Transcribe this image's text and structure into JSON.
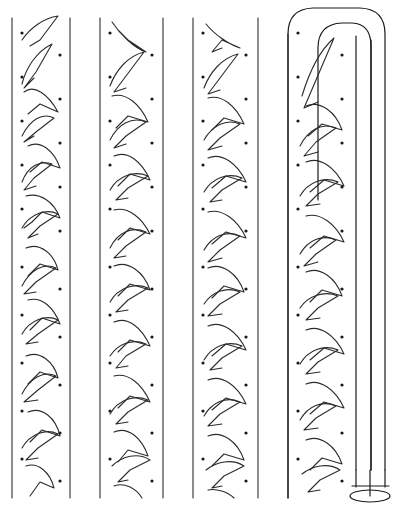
{
  "figure": {
    "type": "technical-line-drawing",
    "canvas": {
      "width": 404,
      "height": 516,
      "background": "#ffffff"
    },
    "stroke_color": "#1a1a1a",
    "glyph_color": "#2b2b2b",
    "dot_color": "#1a1a1a"
  },
  "geometry": {
    "strip_top_y": 18,
    "strip_bottom_y": 498,
    "rules": [
      {
        "name": "rule-1",
        "x": 12
      },
      {
        "name": "rule-2",
        "x": 70
      },
      {
        "name": "rule-3",
        "x": 100
      },
      {
        "name": "rule-4",
        "x": 163
      },
      {
        "name": "rule-5",
        "x": 193
      },
      {
        "name": "rule-6",
        "x": 258
      },
      {
        "name": "rule-7",
        "x": 288
      },
      {
        "name": "rule-8",
        "x": 356
      },
      {
        "name": "rule-9",
        "x": 371
      },
      {
        "name": "rule-10",
        "x": 385
      }
    ],
    "pattern_columns": [
      {
        "name": "pattern-column-1",
        "left": 14,
        "right": 68,
        "glyph_x": 22,
        "dot_left_x": 22,
        "dot_right_x": 60
      },
      {
        "name": "pattern-column-2",
        "left": 102,
        "right": 161,
        "glyph_x": 110,
        "dot_left_x": 110,
        "dot_right_x": 152
      },
      {
        "name": "pattern-column-3",
        "left": 195,
        "right": 256,
        "glyph_x": 203,
        "dot_left_x": 203,
        "dot_right_x": 246
      },
      {
        "name": "pattern-column-4",
        "left": 290,
        "right": 354,
        "glyph_x": 298,
        "dot_left_x": 298,
        "dot_right_x": 342
      }
    ],
    "blank_columns": [
      {
        "name": "blank-column-1",
        "left": 70,
        "right": 100
      },
      {
        "name": "blank-column-2",
        "left": 163,
        "right": 193
      },
      {
        "name": "blank-column-3",
        "left": 258,
        "right": 288
      }
    ],
    "dot_start_y": 33,
    "dot_spacing_y": 44,
    "dot_rows": 11,
    "dot_radius": 1.6,
    "glyph_start_y": 22,
    "glyph_spacing_y": 44,
    "glyph_rows": 11
  },
  "tube": {
    "name": "rounded-top-tube",
    "left_x": 288,
    "right_x": 385,
    "top_y": 8,
    "dome_radius": 26,
    "inner_left_x": 356,
    "inner_mid_x": 371,
    "inner_dome_left_x": 318,
    "inner_dome_top_y": 22,
    "body_bottom_y": 498,
    "base": {
      "name": "tube-base",
      "cap_top_y": 470,
      "cap_bottom_y": 490,
      "ellipse_cx": 370,
      "ellipse_cy": 495,
      "ellipse_rx": 20,
      "ellipse_ry": 6,
      "stem_x": 370,
      "stem_top_y": 470,
      "stem_bottom_y": 495,
      "shelf_y": 486,
      "shelf_left_x": 352,
      "shelf_right_x": 388
    }
  },
  "labels": {
    "figure_caption": "",
    "figure_number": ""
  }
}
